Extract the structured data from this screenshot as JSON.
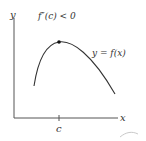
{
  "diagram": {
    "condition_label": "f″(c) < 0",
    "curve_label": "y = f(x)",
    "x_axis_label": "x",
    "y_axis_label": "y",
    "tick_label": "c",
    "colors": {
      "axis": "#555555",
      "curve": "#333333",
      "point": "#111111",
      "text": "#333333"
    }
  }
}
